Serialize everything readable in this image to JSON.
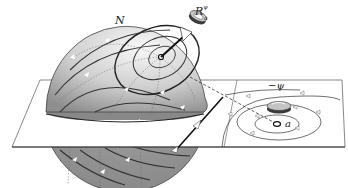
{
  "figure": {
    "labels": {
      "north": "N",
      "rotation_main": "R",
      "rotation_sub": "a",
      "rotation_sup": "ψ",
      "neg_psi": "−ψ",
      "point": "a"
    },
    "colors": {
      "sphere_light": "#f4f4f4",
      "sphere_dark": "#9a9a9a",
      "lines": "#333333",
      "plane": "#ffffff",
      "ring_dark": "#3a3a3a",
      "ring_light": "#c8c8c8"
    }
  }
}
